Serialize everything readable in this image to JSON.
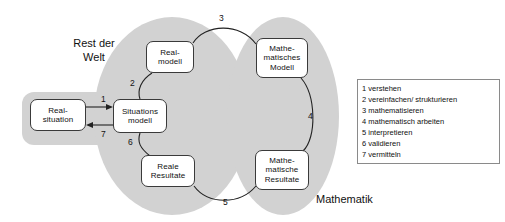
{
  "diagram": {
    "areas": [
      {
        "id": "rest-der-welt",
        "label": "Rest der\nWelt",
        "fill": "#d2d2d2"
      },
      {
        "id": "mathematik",
        "label": "Mathematik",
        "fill": "#d2d2d2"
      }
    ],
    "nodes": [
      {
        "id": "real-situation",
        "lines": [
          "Real-",
          "situation"
        ]
      },
      {
        "id": "situationsmodell",
        "lines": [
          "Situations",
          "modell"
        ]
      },
      {
        "id": "real-modell",
        "lines": [
          "Real-",
          "modell"
        ]
      },
      {
        "id": "reale-resultate",
        "lines": [
          "Reale",
          "Resultate"
        ]
      },
      {
        "id": "mathematisches-modell",
        "lines": [
          "Mathe-",
          "matisches",
          "Modell"
        ]
      },
      {
        "id": "mathematische-resultate",
        "lines": [
          "Mathe-",
          "matische",
          "Resultate"
        ]
      }
    ],
    "node_text": {
      "real_situation_l1": "Real-",
      "real_situation_l2": "situation",
      "situationsmodell_l1": "Situations",
      "situationsmodell_l2": "modell",
      "real_modell_l1": "Real-",
      "real_modell_l2": "modell",
      "reale_resultate_l1": "Reale",
      "reale_resultate_l2": "Resultate",
      "math_modell_l1": "Mathe-",
      "math_modell_l2": "matisches",
      "math_modell_l3": "Modell",
      "math_resultate_l1": "Mathe-",
      "math_resultate_l2": "matische",
      "math_resultate_l3": "Resultate"
    },
    "edges": [
      {
        "number": "1",
        "from": "real-situation",
        "to": "situationsmodell",
        "style": "straight-arrow-right"
      },
      {
        "number": "2",
        "from": "situationsmodell",
        "to": "real-modell",
        "style": "curve"
      },
      {
        "number": "3",
        "from": "real-modell",
        "to": "mathematisches-modell",
        "style": "curve"
      },
      {
        "number": "4",
        "from": "mathematisches-modell",
        "to": "mathematische-resultate",
        "style": "curve"
      },
      {
        "number": "5",
        "from": "mathematische-resultate",
        "to": "reale-resultate",
        "style": "curve"
      },
      {
        "number": "6",
        "from": "reale-resultate",
        "to": "situationsmodell",
        "style": "curve"
      },
      {
        "number": "7",
        "from": "situationsmodell",
        "to": "real-situation",
        "style": "straight-arrow-left"
      }
    ],
    "edge_numbers": {
      "e1": "1",
      "e2": "2",
      "e3": "3",
      "e4": "4",
      "e5": "5",
      "e6": "6",
      "e7": "7"
    },
    "area_labels": {
      "rest_der_welt": "Rest der\nWelt",
      "mathematik": "Mathematik"
    }
  },
  "legend": {
    "items": [
      {
        "number": "1",
        "text": "1 verstehen"
      },
      {
        "number": "2",
        "text": "2 vereinfachen/ strukturieren"
      },
      {
        "number": "3",
        "text": "3 mathematisieren"
      },
      {
        "number": "4",
        "text": "4 mathematisch arbeiten"
      },
      {
        "number": "5",
        "text": "5 interpretieren"
      },
      {
        "number": "6",
        "text": "6 validieren"
      },
      {
        "number": "7",
        "text": "7 vermitteln"
      }
    ],
    "rows": {
      "r0": "1 verstehen",
      "r1": "2 vereinfachen/ strukturieren",
      "r2": "3 mathematisieren",
      "r3": "4 mathematisch arbeiten",
      "r4": "5 interpretieren",
      "r5": "6 validieren",
      "r6": "7 vermitteln"
    }
  },
  "colors": {
    "area_fill": "#d2d2d2",
    "node_fill": "#ffffff",
    "node_stroke": "#3a3a3a",
    "text": "#111111",
    "legend_border": "#8a8a8a",
    "page_background": "#ffffff"
  }
}
